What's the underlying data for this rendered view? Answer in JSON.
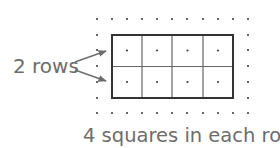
{
  "diagram": {
    "title_label": "2 rows",
    "caption": "4 squares in each row",
    "rows": 2,
    "columns": 4,
    "colors": {
      "grid_line": "#555555",
      "border": "#333333",
      "dot": "#444444",
      "text": "#6d6d6d",
      "arrow": "#6d6d6d"
    }
  }
}
